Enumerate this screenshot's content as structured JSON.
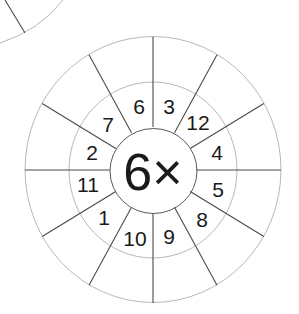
{
  "worksheet": {
    "center_label": "6×",
    "multiplier": 6,
    "inner_numbers": [
      {
        "value": "6",
        "x": 139,
        "y": 106
      },
      {
        "value": "3",
        "x": 169,
        "y": 106
      },
      {
        "value": "12",
        "x": 198,
        "y": 122
      },
      {
        "value": "4",
        "x": 217,
        "y": 152
      },
      {
        "value": "5",
        "x": 218,
        "y": 189
      },
      {
        "value": "8",
        "x": 202,
        "y": 219
      },
      {
        "value": "9",
        "x": 169,
        "y": 236
      },
      {
        "value": "10",
        "x": 135,
        "y": 238
      },
      {
        "value": "1",
        "x": 104,
        "y": 217
      },
      {
        "value": "11",
        "x": 88,
        "y": 184
      },
      {
        "value": "2",
        "x": 92,
        "y": 152
      },
      {
        "value": "7",
        "x": 108,
        "y": 124
      }
    ],
    "outer_answers": [
      "",
      "",
      "",
      "",
      "",
      "",
      "",
      "",
      "",
      "",
      "",
      ""
    ]
  },
  "colors": {
    "ring": "#b8b8b8",
    "spoke": "#4a4a4a",
    "text": "#1a1a1a"
  }
}
